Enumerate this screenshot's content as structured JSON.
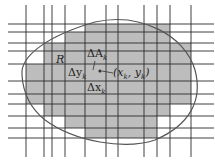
{
  "diagram": {
    "colors": {
      "shade": "#bdbdbd",
      "grid": "#2a2a2a",
      "curve": "#555555",
      "background": "#ffffff"
    },
    "vertical_lines_x": [
      26,
      44,
      52,
      65,
      85,
      106,
      118,
      144,
      157,
      170,
      191
    ],
    "horizontal_lines_y": [
      24,
      32,
      43,
      51,
      64,
      81,
      94,
      104,
      116,
      128,
      138
    ],
    "shaded_rows": [
      {
        "y0": 24,
        "y1": 32,
        "x0": 85,
        "x1": 170
      },
      {
        "y0": 32,
        "y1": 43,
        "x0": 65,
        "x1": 170
      },
      {
        "y0": 43,
        "y1": 51,
        "x0": 44,
        "x1": 191
      },
      {
        "y0": 51,
        "y1": 64,
        "x0": 44,
        "x1": 191
      },
      {
        "y0": 64,
        "y1": 81,
        "x0": 26,
        "x1": 191
      },
      {
        "y0": 81,
        "y1": 94,
        "x0": 26,
        "x1": 191
      },
      {
        "y0": 94,
        "y1": 104,
        "x0": 26,
        "x1": 191
      },
      {
        "y0": 104,
        "y1": 116,
        "x0": 44,
        "x1": 170
      },
      {
        "y0": 116,
        "y1": 128,
        "x0": 65,
        "x1": 157
      },
      {
        "y0": 128,
        "y1": 138,
        "x0": 85,
        "x1": 157
      }
    ],
    "labels": {
      "region": "R",
      "delta_area": "ΔA",
      "delta_area_sub": "k",
      "delta_y": "Δy",
      "delta_y_sub": "k",
      "delta_x": "Δx",
      "delta_x_sub": "k",
      "point_open": "(x",
      "point_sub1": "k",
      "point_mid": ", y",
      "point_sub2": "k",
      "point_close": ")"
    }
  }
}
